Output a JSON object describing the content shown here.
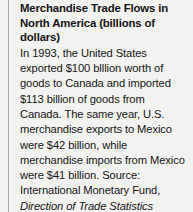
{
  "figure_caption": {
    "title": "Merchandise Trade Flows in North America (billions of dollars)",
    "body_before_citation": "In 1993, the United States exported $100 blllion worth of goods to Canada and imported $113 billion of goods from Canada. The same year, U.S. merchandise exports to Mexico were $42 billion, while merchandise imports from Mexico were $41 billion. Source: International Monetary Fund, ",
    "citation_italic": "Direction of Trade Statistics Yearbook,",
    "body_after_citation": " 1994."
  },
  "colors": {
    "page_background": "#f2f2f0",
    "text": "#161616",
    "title_text": "#141414",
    "margin_rule": "#a9a9a7"
  }
}
